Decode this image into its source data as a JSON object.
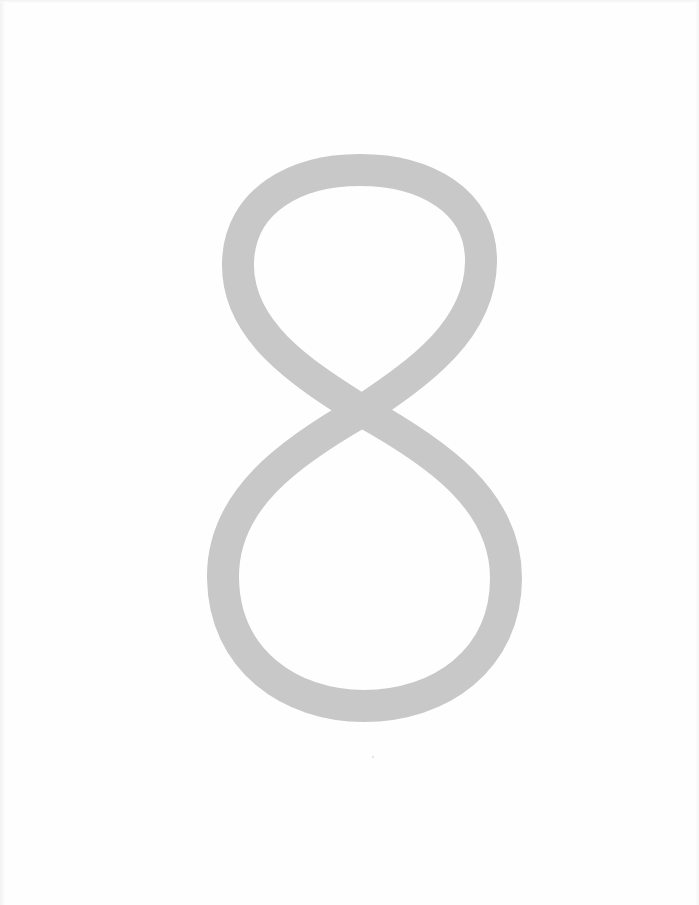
{
  "page": {
    "type": "chapter-divider",
    "numeral": "8",
    "numeral_color": "#c8c8c8",
    "background_color": "#fefefe"
  }
}
